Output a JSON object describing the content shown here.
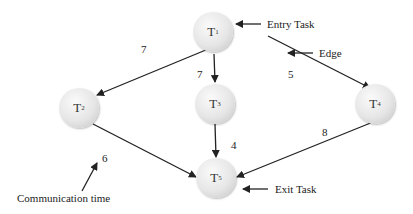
{
  "diagram": {
    "type": "task-graph",
    "nodes": [
      {
        "id": "T1",
        "label": "T",
        "sub": "1",
        "x": 248,
        "y": 32
      },
      {
        "id": "T2",
        "label": "T",
        "sub": "2",
        "x": 79,
        "y": 108
      },
      {
        "id": "T3",
        "label": "T",
        "sub": "3",
        "x": 215,
        "y": 104
      },
      {
        "id": "T4",
        "label": "T",
        "sub": "4",
        "x": 375,
        "y": 104
      },
      {
        "id": "T5",
        "label": "T",
        "sub": "5",
        "x": 216,
        "y": 178
      }
    ],
    "edges": [
      {
        "from": "T1",
        "to": "T2",
        "weight": "7"
      },
      {
        "from": "T1",
        "to": "T3",
        "weight": "7"
      },
      {
        "from": "T1",
        "to": "T4",
        "weight": "5"
      },
      {
        "from": "T2",
        "to": "T5",
        "weight": "6"
      },
      {
        "from": "T3",
        "to": "T5",
        "weight": "4"
      },
      {
        "from": "T4",
        "to": "T5",
        "weight": "8"
      }
    ],
    "annotations": {
      "entry_task": "Entry Task",
      "edge": "Edge",
      "exit_task": "Exit Task",
      "communication_time": "Communication time"
    }
  }
}
